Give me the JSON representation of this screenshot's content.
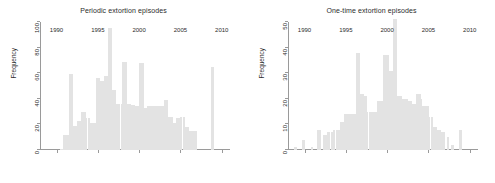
{
  "figure": {
    "width": 495,
    "height": 183,
    "background": "#ffffff",
    "bar_color": "#e3e3e3",
    "axis_color": "#9a9a9a",
    "text_color": "#2b2b2b"
  },
  "panels": {
    "left": {
      "title": "Periodic extortion episodes",
      "ylabel": "Frequency"
    },
    "right": {
      "title": "One-time extortion episodes",
      "ylabel": "Frequency"
    }
  },
  "chart_data": [
    {
      "type": "bar",
      "title": "Periodic extortion episodes",
      "xlabel": "",
      "ylabel": "Frequency",
      "xlim": [
        1988,
        2011
      ],
      "ylim": [
        0,
        100
      ],
      "xticks": [
        1990,
        1995,
        2000,
        2005,
        2010
      ],
      "yticks": [
        0,
        20,
        40,
        60,
        80,
        100
      ],
      "grid": false,
      "legend": "none",
      "bin_width": 0.25,
      "x": [
        1990.6,
        1990.9,
        1991.1,
        1991.4,
        1991.6,
        1991.9,
        1992.1,
        1992.4,
        1992.6,
        1992.9,
        1993.1,
        1993.4,
        1993.6,
        1993.9,
        1994.1,
        1994.4,
        1994.6,
        1994.9,
        1995.1,
        1995.4,
        1995.6,
        1995.9,
        1996.1,
        1996.4,
        1996.6,
        1996.9,
        1997.1,
        1997.4,
        1997.6,
        1997.9,
        1998.1,
        1998.4,
        1998.6,
        1998.9,
        1999.1,
        1999.4,
        1999.6,
        1999.9,
        2000.1,
        2000.4,
        2000.6,
        2000.9,
        2001.1,
        2001.4,
        2001.6,
        2001.9,
        2002.1,
        2002.4,
        2002.6,
        2002.9,
        2003.1,
        2003.4,
        2003.6,
        2003.9,
        2004.1,
        2004.4,
        2004.6,
        2004.9,
        2005.1,
        2005.4,
        2005.6,
        2005.9,
        2006.1,
        2006.4,
        2006.6,
        2006.9,
        2008.9
      ],
      "values": [
        1,
        12,
        12,
        12,
        59,
        59,
        19,
        19,
        23,
        23,
        30,
        30,
        25,
        25,
        21,
        21,
        21,
        56,
        56,
        54,
        54,
        58,
        58,
        95,
        95,
        47,
        47,
        36,
        36,
        36,
        69,
        69,
        36,
        36,
        35,
        35,
        34,
        34,
        68,
        68,
        33,
        33,
        34,
        34,
        34,
        34,
        34,
        34,
        34,
        34,
        39,
        39,
        26,
        26,
        21,
        21,
        25,
        25,
        26,
        26,
        18,
        18,
        15,
        15,
        15,
        15,
        65
      ]
    },
    {
      "type": "bar",
      "title": "One-time extortion episodes",
      "xlabel": "",
      "ylabel": "Frequency",
      "xlim": [
        1988,
        2011
      ],
      "ylim": [
        0,
        50
      ],
      "xticks": [
        1990,
        1995,
        2000,
        2005,
        2010
      ],
      "yticks": [
        0,
        10,
        20,
        30,
        40,
        50
      ],
      "grid": false,
      "legend": "none",
      "bin_width": 0.25,
      "x": [
        1988.9,
        1989.9,
        1990.9,
        1991.6,
        1991.9,
        1992.4,
        1992.6,
        1992.9,
        1993.4,
        1993.6,
        1993.9,
        1994.1,
        1994.4,
        1994.6,
        1994.9,
        1995.1,
        1995.4,
        1995.6,
        1995.9,
        1996.1,
        1996.4,
        1996.6,
        1996.9,
        1997.1,
        1997.4,
        1997.6,
        1997.9,
        1998.1,
        1998.4,
        1998.6,
        1998.9,
        1999.1,
        1999.4,
        1999.6,
        1999.9,
        2000.1,
        2000.4,
        2000.6,
        2000.9,
        2001.1,
        2001.4,
        2001.6,
        2001.9,
        2002.1,
        2002.4,
        2002.6,
        2002.9,
        2003.1,
        2003.4,
        2003.6,
        2003.9,
        2004.1,
        2004.4,
        2004.6,
        2004.9,
        2005.1,
        2005.4,
        2005.6,
        2005.9,
        2006.1,
        2006.4,
        2006.6,
        2006.9,
        2007.4,
        2007.9,
        2008.9
      ],
      "values": [
        1,
        4,
        1,
        8,
        8,
        6,
        6,
        7,
        7,
        8,
        8,
        8,
        11,
        11,
        14,
        14,
        14,
        14,
        14,
        14,
        38,
        38,
        22,
        22,
        21,
        15,
        15,
        15,
        15,
        15,
        19,
        19,
        19,
        37,
        37,
        37,
        31,
        31,
        51,
        51,
        21,
        21,
        20,
        20,
        20,
        19,
        19,
        18,
        18,
        22,
        22,
        20,
        17,
        17,
        17,
        13,
        13,
        9,
        9,
        8,
        8,
        7,
        7,
        5,
        2,
        8
      ]
    }
  ]
}
